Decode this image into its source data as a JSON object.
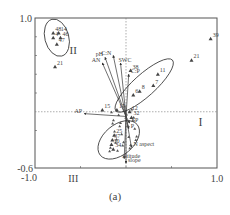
{
  "figure": {
    "caption": "(a)"
  },
  "chart_data": {
    "type": "scatter",
    "title": "",
    "xlabel": "",
    "ylabel": "",
    "xlim": [
      -1.0,
      1.0
    ],
    "ylim": [
      -0.6,
      1.0
    ],
    "x_tick_labels": [
      "-1.0",
      "1.0"
    ],
    "y_tick_labels": [
      "1.0",
      "-0.6"
    ],
    "grid": false,
    "quadrant_labels": [
      "I",
      "II",
      "III"
    ],
    "sample_points": [
      {
        "label": "48",
        "x": -0.8,
        "y": 0.84
      },
      {
        "label": "14",
        "x": -0.74,
        "y": 0.84
      },
      {
        "label": "4",
        "x": -0.8,
        "y": 0.79
      },
      {
        "label": "46",
        "x": -0.72,
        "y": 0.79
      },
      {
        "label": "47",
        "x": -0.76,
        "y": 0.72
      },
      {
        "label": "21",
        "x": -0.78,
        "y": 0.48
      },
      {
        "label": "39",
        "x": 0.93,
        "y": 0.78
      },
      {
        "label": "21",
        "x": 0.72,
        "y": 0.55
      },
      {
        "label": "11",
        "x": 0.35,
        "y": 0.4
      },
      {
        "label": "7",
        "x": 0.3,
        "y": 0.28
      },
      {
        "label": "8",
        "x": 0.15,
        "y": 0.22
      },
      {
        "label": "6",
        "x": 0.08,
        "y": 0.18
      },
      {
        "label": "12",
        "x": 0.04,
        "y": 0.0
      },
      {
        "label": "32",
        "x": 0.06,
        "y": -0.06
      },
      {
        "label": "38",
        "x": 0.05,
        "y": 0.44
      },
      {
        "label": "15",
        "x": -0.26,
        "y": 0.02
      },
      {
        "label": "17",
        "x": -0.1,
        "y": 0.02
      },
      {
        "label": "25",
        "x": -0.13,
        "y": -0.25
      },
      {
        "label": "37",
        "x": -0.15,
        "y": -0.3
      },
      {
        "label": "30",
        "x": -0.16,
        "y": -0.35
      },
      {
        "label": "34",
        "x": -0.14,
        "y": -0.4
      }
    ],
    "env_vectors": [
      {
        "label": "pH",
        "x": -0.23,
        "y": 0.58
      },
      {
        "label": "AN",
        "x": -0.26,
        "y": 0.52
      },
      {
        "label": "C:N",
        "x": -0.14,
        "y": 0.6
      },
      {
        "label": "SWC",
        "x": -0.06,
        "y": 0.52
      },
      {
        "label": "C:P",
        "x": 0.03,
        "y": 0.4
      },
      {
        "label": "AP",
        "x": -0.46,
        "y": -0.02
      },
      {
        "label": "SP",
        "x": 0.04,
        "y": -0.12
      },
      {
        "label": "P",
        "x": 0.03,
        "y": -0.18
      },
      {
        "label": "N aspect",
        "x": 0.06,
        "y": -0.38
      },
      {
        "label": "altitude",
        "x": -0.02,
        "y": -0.5
      },
      {
        "label": "slope",
        "x": 0.0,
        "y": -0.55
      }
    ],
    "groups": [
      {
        "name": "upper-left cluster",
        "members": [
          "48",
          "14",
          "4",
          "46",
          "47"
        ]
      },
      {
        "name": "right cluster",
        "members": [
          "11",
          "7",
          "8",
          "6"
        ]
      },
      {
        "name": "lower cluster",
        "members": [
          "15",
          "25",
          "37",
          "30",
          "34"
        ]
      }
    ]
  }
}
